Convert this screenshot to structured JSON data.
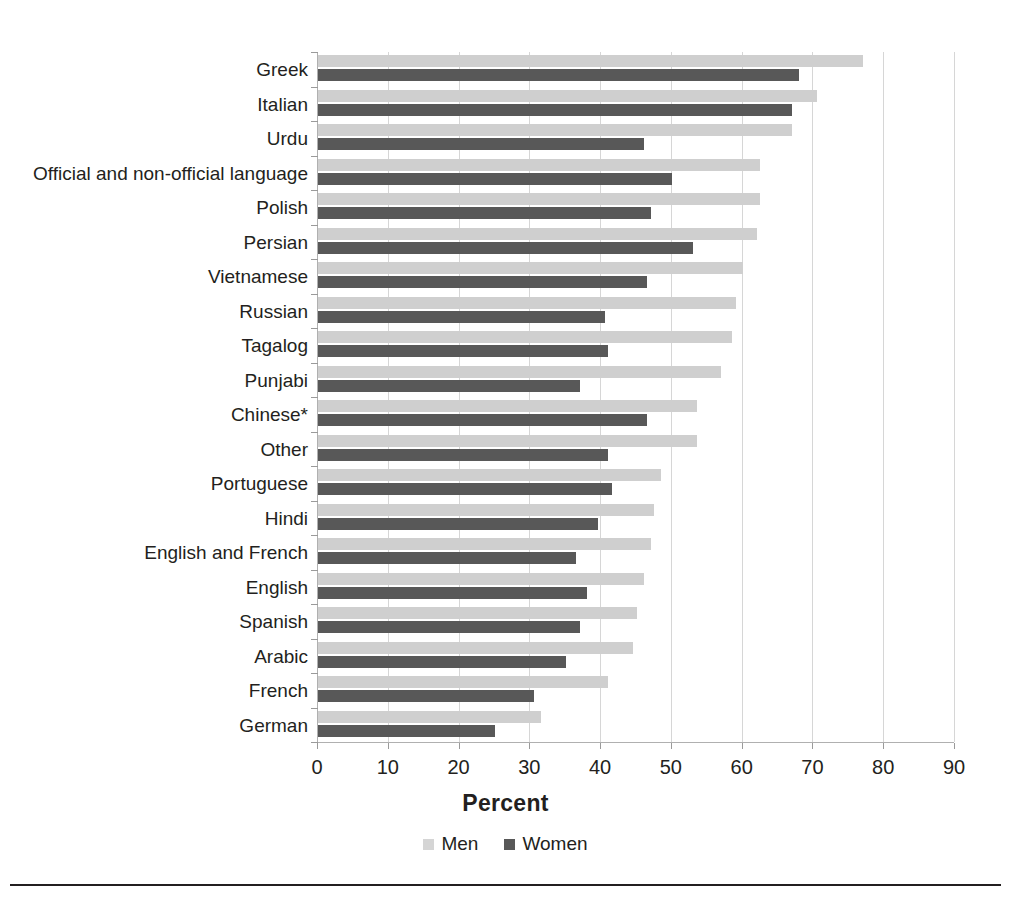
{
  "chart_data": {
    "type": "bar",
    "orientation": "horizontal",
    "title": "",
    "xlabel": "Percent",
    "ylabel": "",
    "xlim": [
      0,
      90
    ],
    "xticks": [
      0,
      10,
      20,
      30,
      40,
      50,
      60,
      70,
      80,
      90
    ],
    "grid": "vertical",
    "legend_position": "bottom",
    "categories": [
      "Greek",
      "Italian",
      "Urdu",
      "Official and non-official language",
      "Polish",
      "Persian",
      "Vietnamese",
      "Russian",
      "Tagalog",
      "Punjabi",
      "Chinese*",
      "Other",
      "Portuguese",
      "Hindi",
      "English and French",
      "English",
      "Spanish",
      "Arabic",
      "French",
      "German"
    ],
    "series": [
      {
        "name": "Men",
        "color": "#cfcfcf",
        "values": [
          77.0,
          70.5,
          67.0,
          62.5,
          62.5,
          62.0,
          60.0,
          59.0,
          58.5,
          57.0,
          53.5,
          53.5,
          48.5,
          47.5,
          47.0,
          46.0,
          45.0,
          44.5,
          41.0,
          31.5
        ]
      },
      {
        "name": "Women",
        "color": "#585858",
        "values": [
          68.0,
          67.0,
          46.0,
          50.0,
          47.0,
          53.0,
          46.5,
          40.5,
          41.0,
          37.0,
          46.5,
          41.0,
          41.5,
          39.5,
          36.5,
          38.0,
          37.0,
          35.0,
          30.5,
          25.0
        ]
      }
    ]
  },
  "legend": {
    "items": [
      {
        "label": "Men"
      },
      {
        "label": "Women"
      }
    ]
  },
  "axis": {
    "x_title": "Percent"
  }
}
